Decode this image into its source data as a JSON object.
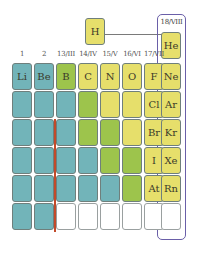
{
  "colors": {
    "metal": "#72b4b9",
    "metalloid": "#9dc44c",
    "nonmetal": "#e6df6b",
    "empty": "#ffffff",
    "group18_outline": "#6a5fa8",
    "divider_line": "#c24a2a"
  },
  "hydrogen": {
    "symbol": "H",
    "class": "nonmetal"
  },
  "group_headers": [
    "1",
    "2",
    "13/III",
    "14/IV",
    "15/V",
    "16/VI",
    "17/VII"
  ],
  "group18_label": "18/VIII",
  "helium": {
    "symbol": "He",
    "class": "nonmetal"
  },
  "rows": [
    {
      "period": 2,
      "cells": [
        {
          "symbol": "Li",
          "class": "metal"
        },
        {
          "symbol": "Be",
          "class": "metal"
        },
        {
          "symbol": "B",
          "class": "metalloid"
        },
        {
          "symbol": "C",
          "class": "nonmetal"
        },
        {
          "symbol": "N",
          "class": "nonmetal"
        },
        {
          "symbol": "O",
          "class": "nonmetal"
        },
        {
          "symbol": "F",
          "class": "nonmetal"
        },
        {
          "symbol": "Ne",
          "class": "nonmetal"
        }
      ]
    },
    {
      "period": 3,
      "cells": [
        {
          "symbol": "",
          "class": "metal"
        },
        {
          "symbol": "",
          "class": "metal"
        },
        {
          "symbol": "",
          "class": "metal"
        },
        {
          "symbol": "",
          "class": "metalloid"
        },
        {
          "symbol": "",
          "class": "nonmetal"
        },
        {
          "symbol": "",
          "class": "nonmetal"
        },
        {
          "symbol": "Cl",
          "class": "nonmetal"
        },
        {
          "symbol": "Ar",
          "class": "nonmetal"
        }
      ]
    },
    {
      "period": 4,
      "cells": [
        {
          "symbol": "",
          "class": "metal"
        },
        {
          "symbol": "",
          "class": "metal"
        },
        {
          "symbol": "",
          "class": "metal"
        },
        {
          "symbol": "",
          "class": "metalloid"
        },
        {
          "symbol": "",
          "class": "metalloid"
        },
        {
          "symbol": "",
          "class": "nonmetal"
        },
        {
          "symbol": "Br",
          "class": "nonmetal"
        },
        {
          "symbol": "Kr",
          "class": "nonmetal"
        }
      ]
    },
    {
      "period": 5,
      "cells": [
        {
          "symbol": "",
          "class": "metal"
        },
        {
          "symbol": "",
          "class": "metal"
        },
        {
          "symbol": "",
          "class": "metal"
        },
        {
          "symbol": "",
          "class": "metal"
        },
        {
          "symbol": "",
          "class": "metalloid"
        },
        {
          "symbol": "",
          "class": "metalloid"
        },
        {
          "symbol": "I",
          "class": "nonmetal"
        },
        {
          "symbol": "Xe",
          "class": "nonmetal"
        }
      ]
    },
    {
      "period": 6,
      "cells": [
        {
          "symbol": "",
          "class": "metal"
        },
        {
          "symbol": "",
          "class": "metal"
        },
        {
          "symbol": "",
          "class": "metal"
        },
        {
          "symbol": "",
          "class": "metal"
        },
        {
          "symbol": "",
          "class": "metal"
        },
        {
          "symbol": "",
          "class": "metalloid"
        },
        {
          "symbol": "At",
          "class": "nonmetal"
        },
        {
          "symbol": "Rn",
          "class": "nonmetal"
        }
      ]
    },
    {
      "period": 7,
      "cells": [
        {
          "symbol": "",
          "class": "metal"
        },
        {
          "symbol": "",
          "class": "metal"
        },
        {
          "symbol": "",
          "class": "empty"
        },
        {
          "symbol": "",
          "class": "empty"
        },
        {
          "symbol": "",
          "class": "empty"
        },
        {
          "symbol": "",
          "class": "empty"
        },
        {
          "symbol": "",
          "class": "empty"
        },
        {
          "symbol": "",
          "class": "empty"
        }
      ]
    }
  ]
}
